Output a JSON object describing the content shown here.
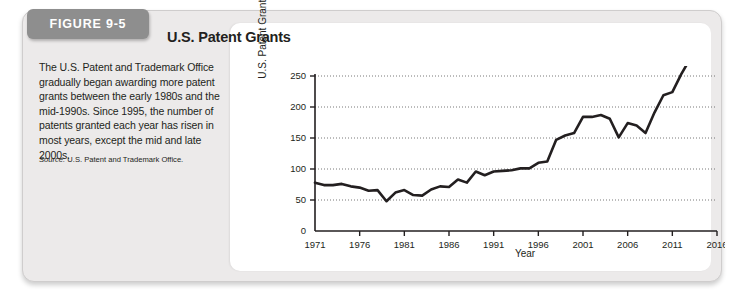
{
  "figure": {
    "tab_label": "FIGURE 9-5",
    "caption": "The U.S. Patent and Trademark Office gradually began awarding more patent grants between the early 1980s and the mid-1990s. Since 1995, the number of patents granted each year has risen in most years, except the mid and late 2000s.",
    "source_label": "Source:",
    "source_text": " U.S. Patent and Trademark Office."
  },
  "chart_data": {
    "type": "line",
    "title": "U.S. Patent Grants",
    "xlabel": "Year",
    "ylabel": "U.S. Patent Grants (thousands)",
    "xlim": [
      1971,
      2016
    ],
    "ylim": [
      0,
      250
    ],
    "xticks": [
      1971,
      1976,
      1981,
      1986,
      1991,
      1996,
      2001,
      2006,
      2011,
      2016
    ],
    "yticks": [
      0,
      50,
      100,
      150,
      200,
      250
    ],
    "grid": true,
    "legend": "none",
    "line_color": "#231f20",
    "x": [
      1971,
      1972,
      1973,
      1974,
      1975,
      1976,
      1977,
      1978,
      1979,
      1980,
      1981,
      1982,
      1983,
      1984,
      1985,
      1986,
      1987,
      1988,
      1989,
      1990,
      1991,
      1992,
      1993,
      1994,
      1995,
      1996,
      1997,
      1998,
      1999,
      2000,
      2001,
      2002,
      2003,
      2004,
      2005,
      2006,
      2007,
      2008,
      2009,
      2010,
      2011,
      2012,
      2013
    ],
    "values": [
      78,
      74,
      74,
      76,
      72,
      70,
      65,
      66,
      48,
      62,
      66,
      58,
      57,
      67,
      72,
      71,
      83,
      78,
      96,
      90,
      96,
      97,
      98,
      101,
      101,
      110,
      112,
      147,
      154,
      158,
      184,
      184,
      187,
      181,
      151,
      174,
      170,
      158,
      191,
      219,
      224,
      253,
      278
    ],
    "note": "Curve read off plot; values in thousands of patent grants."
  }
}
